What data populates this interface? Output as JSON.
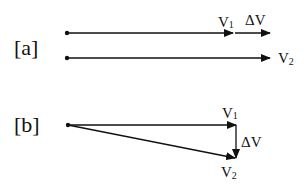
{
  "diagram": {
    "stroke_color": "#111111",
    "background": "#ffffff",
    "panels": [
      {
        "id": "a",
        "label": "[a]",
        "vectors": [
          {
            "name": "V1",
            "letter": "V",
            "subscript": "1",
            "from": [
              67,
              33
            ],
            "to": [
              233,
              33
            ]
          },
          {
            "name": "ΔV",
            "label": "ΔV",
            "from": [
              235,
              33
            ],
            "to": [
              270,
              33
            ]
          },
          {
            "name": "V2",
            "letter": "V",
            "subscript": "2",
            "from": [
              67,
              58
            ],
            "to": [
              270,
              58
            ]
          }
        ]
      },
      {
        "id": "b",
        "label": "[b]",
        "vectors": [
          {
            "name": "V1",
            "letter": "V",
            "subscript": "1",
            "from": [
              68,
              125
            ],
            "to": [
              236,
              125
            ]
          },
          {
            "name": "ΔV",
            "label": "ΔV",
            "from": [
              236,
              125
            ],
            "to": [
              236,
              158
            ]
          },
          {
            "name": "V2",
            "letter": "V",
            "subscript": "2",
            "from": [
              68,
              125
            ],
            "to": [
              236,
              158
            ]
          }
        ]
      }
    ]
  }
}
